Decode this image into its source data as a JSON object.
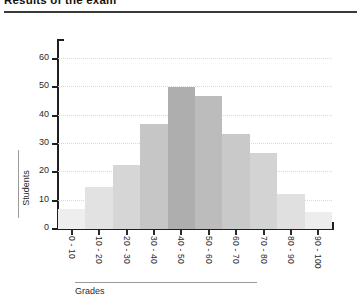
{
  "chart_data": {
    "type": "bar",
    "title": "Results of the exam",
    "xlabel": "Grades",
    "ylabel": "Students",
    "categories": [
      "0 - 10",
      "10 - 20",
      "20 - 30",
      "30 - 40",
      "40 - 50",
      "50 - 60",
      "60 - 70",
      "70 - 80",
      "80 - 90",
      "90 - 100"
    ],
    "values": [
      7,
      15,
      22.5,
      37,
      50,
      47,
      33.5,
      27,
      12.5,
      6
    ],
    "series": [
      {
        "name": "Students",
        "values": [
          7,
          15,
          22.5,
          37,
          50,
          47,
          33.5,
          27,
          12.5,
          6
        ]
      }
    ],
    "bar_colors": [
      "#eeeeee",
      "#e2e2e2",
      "#d6d6d6",
      "#c6c6c6",
      "#aeaeae",
      "#bcbcbc",
      "#c9c9c9",
      "#d3d3d3",
      "#e0e0e0",
      "#ededed"
    ],
    "ylim": [
      0,
      65
    ],
    "yticks": [
      0,
      10,
      20,
      30,
      40,
      50,
      60
    ],
    "ytick_labels": [
      "0",
      "10",
      "20",
      "30",
      "40",
      "50",
      "60"
    ],
    "grid": true,
    "grid_color": "#d9d9d9",
    "legend": null,
    "legend_position": "none",
    "axis_color": "#1f1f1f",
    "xlabel_rotation": 90
  },
  "header": {
    "title": "Results of the exam"
  }
}
